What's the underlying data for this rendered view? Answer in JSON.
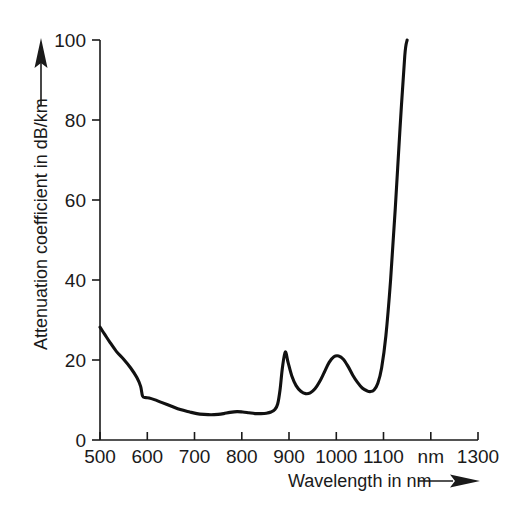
{
  "chart_data": {
    "type": "line",
    "title": "",
    "xlabel": "Wavelength in nm",
    "ylabel": "Attenuation coefficient in dB/km",
    "xlim": [
      500,
      1300
    ],
    "ylim": [
      0,
      100
    ],
    "grid": false,
    "legend": "none",
    "x_unit_label": "nm",
    "x_unit_label_at": 1200,
    "xticks": [
      500,
      600,
      700,
      800,
      900,
      1000,
      1100,
      1200,
      1300
    ],
    "xtick_labels": [
      "500",
      "600",
      "700",
      "800",
      "900",
      "1000",
      "1100",
      "nm",
      "1300"
    ],
    "yticks": [
      0,
      20,
      40,
      60,
      80,
      100
    ],
    "ytick_labels": [
      "0",
      "20",
      "40",
      "60",
      "80",
      "100"
    ],
    "series": [
      {
        "name": "Attenuation",
        "color": "#111111",
        "x": [
          500,
          510,
          520,
          535,
          550,
          565,
          578,
          586,
          590,
          596,
          604,
          615,
          630,
          650,
          670,
          690,
          705,
          720,
          735,
          750,
          762,
          775,
          790,
          802,
          815,
          828,
          840,
          852,
          862,
          870,
          876,
          881,
          886,
          892,
          898,
          906,
          915,
          925,
          935,
          945,
          955,
          965,
          975,
          985,
          995,
          1005,
          1015,
          1025,
          1035,
          1045,
          1055,
          1065,
          1072,
          1080,
          1088,
          1096,
          1105,
          1115,
          1125,
          1135,
          1145,
          1150
        ],
        "y": [
          28.2,
          26.4,
          24.6,
          22.1,
          20.2,
          18.0,
          15.6,
          13.4,
          11.0,
          10.6,
          10.5,
          10.1,
          9.4,
          8.5,
          7.6,
          7.0,
          6.6,
          6.4,
          6.3,
          6.4,
          6.6,
          6.9,
          7.1,
          7.0,
          6.8,
          6.6,
          6.6,
          6.7,
          7.0,
          7.6,
          9.0,
          12.5,
          18.0,
          22.0,
          19.4,
          16.0,
          13.6,
          12.2,
          11.6,
          11.8,
          12.8,
          14.6,
          17.0,
          19.4,
          20.8,
          21.0,
          20.2,
          18.4,
          16.2,
          14.4,
          13.0,
          12.3,
          12.1,
          12.5,
          14.2,
          18.0,
          26.0,
          40.0,
          58.0,
          78.0,
          96.0,
          100.0
        ]
      }
    ],
    "annotations": [
      {
        "name": "x-axis-arrow",
        "glyph": "right-arrow"
      },
      {
        "name": "y-axis-arrow",
        "glyph": "up-arrow"
      }
    ]
  },
  "axes": {
    "x_title": "Wavelength in nm",
    "y_title": "Attenuation coefficient in dB/km"
  }
}
